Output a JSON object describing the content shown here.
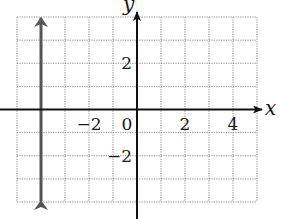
{
  "chart_data": {
    "type": "line",
    "title": "",
    "xlabel": "x",
    "ylabel": "y",
    "xlim": [
      -5,
      5
    ],
    "ylim": [
      -4,
      4
    ],
    "grid": true,
    "grid_style": "dotted",
    "x_ticks": [
      {
        "value": -2,
        "label": "−2"
      },
      {
        "value": 0,
        "label": "0"
      },
      {
        "value": 2,
        "label": "2"
      },
      {
        "value": 4,
        "label": "4"
      }
    ],
    "y_ticks": [
      {
        "value": 2,
        "label": "2"
      },
      {
        "value": -2,
        "label": "−2"
      }
    ],
    "series": [
      {
        "name": "vertical line x = -4",
        "equation": "x = -4",
        "points": [
          [
            -4,
            -4
          ],
          [
            -4,
            4
          ]
        ],
        "arrows": "both",
        "color": "#555555"
      }
    ]
  },
  "colors": {
    "axis": "#111111",
    "grid": "#8a8a8a",
    "series": "#555555"
  }
}
